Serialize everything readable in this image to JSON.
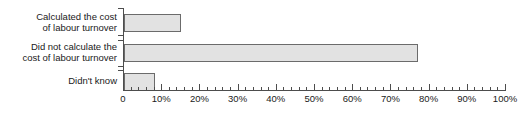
{
  "chart_data": {
    "type": "bar",
    "orientation": "horizontal",
    "title": "",
    "subtitle": "",
    "xlabel": "",
    "ylabel": "",
    "categories": [
      "Calculated the cost\nof labour turnover",
      "Did not calculate the\ncost of labour turnover",
      "Didn't know"
    ],
    "values": [
      15,
      77,
      8
    ],
    "value_unit": "%",
    "xlim": [
      0,
      100
    ],
    "xticks": [
      0,
      10,
      20,
      30,
      40,
      50,
      60,
      70,
      80,
      90,
      100
    ],
    "xtick_labels": [
      "0",
      "10%",
      "20%",
      "30%",
      "40%",
      "50%",
      "60%",
      "70%",
      "80%",
      "90%",
      "100%"
    ],
    "minor_tick_step": 2,
    "grid": false,
    "legend": null,
    "annotations": [],
    "colors": {
      "bar_fill": "#e2e2e2",
      "bar_border": "#6b6b6b",
      "axis": "#4d4d4d",
      "text": "#1a1a1a",
      "background": "#ffffff"
    }
  }
}
